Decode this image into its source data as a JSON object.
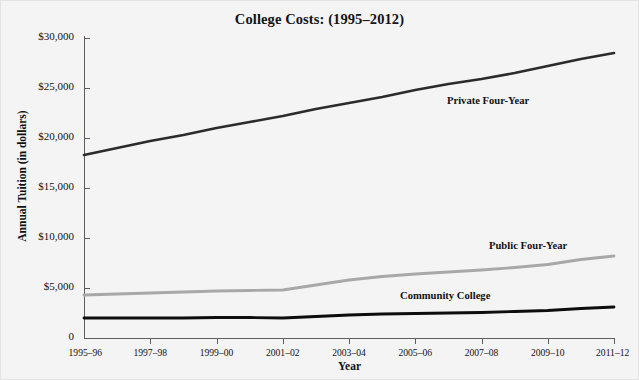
{
  "figure": {
    "background_color": "#f4f4f4",
    "border_color": "#e3e3e3"
  },
  "chart_data": {
    "type": "line",
    "title": "College Costs: (1995–2012)",
    "xlabel": "Year",
    "ylabel": "Annual Tuition (in dollars)",
    "grid": false,
    "legend_position": "inline-annotations",
    "ylim": [
      0,
      30000
    ],
    "ytick_values": [
      0,
      5000,
      10000,
      15000,
      20000,
      25000,
      30000
    ],
    "ytick_labels": [
      "0",
      "$5,000",
      "$10,000",
      "$15,000",
      "$20,000",
      "$25,000",
      "$30,000"
    ],
    "categories": [
      "1995–96",
      "1996–97",
      "1997–98",
      "1998–99",
      "1999–00",
      "2000–01",
      "2001–02",
      "2002–03",
      "2003–04",
      "2004–05",
      "2005–06",
      "2006–07",
      "2007–08",
      "2008–09",
      "2009–10",
      "2010–11",
      "2011–12"
    ],
    "xtick_labels": [
      "1995–96",
      "1997–98",
      "1999–00",
      "2001–02",
      "2003–04",
      "2005–06",
      "2007–08",
      "2009–10",
      "2011–12"
    ],
    "series": [
      {
        "name": "Private Four-Year",
        "color": "#2b2b2b",
        "width": 2.6,
        "values": [
          18300,
          19000,
          19700,
          20300,
          21000,
          21600,
          22200,
          22900,
          23500,
          24100,
          24800,
          25400,
          25900,
          26500,
          27200,
          27900,
          28500
        ]
      },
      {
        "name": "Public Four-Year",
        "color": "#a8a8a8",
        "width": 2.8,
        "values": [
          4300,
          4400,
          4500,
          4600,
          4700,
          4750,
          4800,
          5300,
          5800,
          6150,
          6400,
          6600,
          6800,
          7050,
          7350,
          7850,
          8200
        ]
      },
      {
        "name": "Community College",
        "color": "#0d0d0d",
        "width": 2.8,
        "values": [
          2000,
          2000,
          2000,
          2000,
          2050,
          2050,
          2000,
          2150,
          2300,
          2400,
          2450,
          2500,
          2550,
          2650,
          2750,
          2950,
          3100
        ]
      }
    ],
    "annotations": [
      {
        "text": "Private Four-Year",
        "x_px": 447,
        "y_px": 95
      },
      {
        "text": "Public Four-Year",
        "x_px": 489,
        "y_px": 240
      },
      {
        "text": "Community College",
        "x_px": 400,
        "y_px": 290
      }
    ]
  }
}
